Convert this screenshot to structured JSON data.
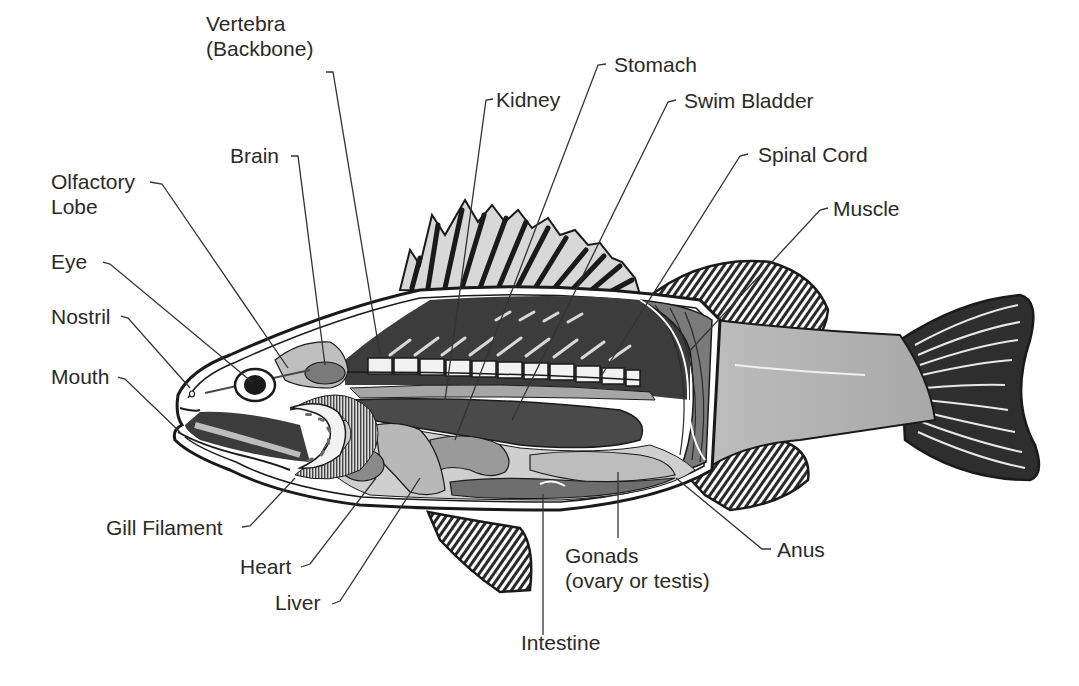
{
  "figure": {
    "labels": {
      "vertebra": [
        "Vertebra",
        "(Backbone)"
      ],
      "brain": [
        "Brain"
      ],
      "olfactory_lobe": [
        "Olfactory",
        "Lobe"
      ],
      "eye": [
        "Eye"
      ],
      "nostril": [
        "Nostril"
      ],
      "mouth": [
        "Mouth"
      ],
      "gill_filament": [
        "Gill Filament"
      ],
      "heart": [
        "Heart"
      ],
      "liver": [
        "Liver"
      ],
      "kidney": [
        "Kidney"
      ],
      "stomach": [
        "Stomach"
      ],
      "swim_bladder": [
        "Swim Bladder"
      ],
      "spinal_cord": [
        "Spinal Cord"
      ],
      "muscle": [
        "Muscle"
      ],
      "intestine": [
        "Intestine"
      ],
      "gonads": [
        "Gonads",
        "(ovary or testis)"
      ],
      "anus": [
        "Anus"
      ]
    },
    "colors": {
      "outline": "#1a1a1a",
      "dark_cavity": "#3c3c3c",
      "swim_bladder": "#4a4a4a",
      "kidney": "#8c8c8c",
      "muscle": "#7a7a7a",
      "body_light": "#b4b4b4",
      "organ_light": "#c8c8c8",
      "tail_fin": "#2e2e2e",
      "label_text": "#2a2a2a"
    }
  }
}
